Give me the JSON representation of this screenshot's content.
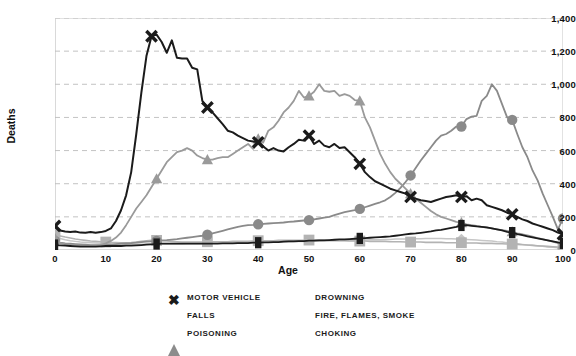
{
  "chart_data": {
    "type": "line",
    "title": "",
    "xlabel": "Age",
    "ylabel": "Deaths",
    "xlim": [
      0,
      100
    ],
    "ylim": [
      0,
      1400
    ],
    "grid": true,
    "grid_style": "dashed-horizontal",
    "legend_position": "bottom",
    "x_ticks": [
      0,
      10,
      20,
      30,
      40,
      50,
      60,
      70,
      80,
      90,
      100
    ],
    "y_ticks": [
      "0",
      "200",
      "400",
      "600",
      "800",
      "1,000",
      "1,200",
      "1,400"
    ],
    "y_tick_values": [
      0,
      200,
      400,
      600,
      800,
      1000,
      1200,
      1400
    ],
    "x": [
      0,
      1,
      2,
      3,
      4,
      5,
      6,
      7,
      8,
      9,
      10,
      11,
      12,
      13,
      14,
      15,
      16,
      17,
      18,
      19,
      20,
      21,
      22,
      23,
      24,
      25,
      26,
      27,
      28,
      29,
      30,
      31,
      32,
      33,
      34,
      35,
      36,
      37,
      38,
      39,
      40,
      41,
      42,
      43,
      44,
      45,
      46,
      47,
      48,
      49,
      50,
      51,
      52,
      53,
      54,
      55,
      56,
      57,
      58,
      59,
      60,
      61,
      62,
      63,
      64,
      65,
      66,
      67,
      68,
      69,
      70,
      71,
      72,
      73,
      74,
      75,
      76,
      77,
      78,
      79,
      80,
      81,
      82,
      83,
      84,
      85,
      86,
      87,
      88,
      89,
      90,
      91,
      92,
      93,
      94,
      95,
      96,
      97,
      98,
      99,
      100
    ],
    "series": [
      {
        "name": "MOTOR VEHICLE",
        "marker": "x",
        "color": "#1b1b1b",
        "width": 2.0,
        "marker_at": [
          0,
          19,
          30,
          40,
          50,
          60,
          70,
          80,
          90,
          100
        ],
        "values": [
          145,
          118,
          112,
          108,
          112,
          105,
          104,
          108,
          104,
          108,
          115,
          130,
          175,
          240,
          330,
          470,
          700,
          950,
          1170,
          1290,
          1300,
          1255,
          1190,
          1265,
          1160,
          1155,
          1155,
          1100,
          1090,
          900,
          860,
          830,
          795,
          760,
          720,
          710,
          690,
          675,
          660,
          655,
          650,
          625,
          600,
          615,
          600,
          595,
          620,
          640,
          665,
          660,
          690,
          640,
          660,
          630,
          620,
          640,
          615,
          620,
          590,
          560,
          520,
          470,
          440,
          415,
          400,
          385,
          370,
          360,
          350,
          340,
          320,
          310,
          300,
          295,
          290,
          300,
          310,
          320,
          325,
          330,
          320,
          325,
          300,
          310,
          300,
          270,
          260,
          250,
          240,
          225,
          215,
          200,
          185,
          175,
          160,
          150,
          140,
          130,
          120,
          105,
          95
        ]
      },
      {
        "name": "FALLS",
        "marker": "circle",
        "color": "#8a8a8a",
        "width": 1.8,
        "marker_at": [
          0,
          20,
          30,
          40,
          50,
          60,
          70,
          80,
          90,
          100
        ],
        "values": [
          55,
          45,
          40,
          38,
          36,
          34,
          32,
          30,
          30,
          30,
          30,
          32,
          35,
          38,
          40,
          42,
          45,
          48,
          50,
          52,
          55,
          58,
          60,
          63,
          66,
          70,
          74,
          78,
          82,
          86,
          92,
          100,
          108,
          116,
          124,
          132,
          140,
          145,
          150,
          152,
          155,
          158,
          160,
          162,
          164,
          166,
          170,
          172,
          175,
          178,
          180,
          185,
          190,
          195,
          200,
          210,
          220,
          228,
          235,
          240,
          248,
          258,
          268,
          278,
          288,
          300,
          320,
          345,
          375,
          410,
          450,
          495,
          540,
          580,
          620,
          660,
          690,
          700,
          720,
          745,
          745,
          790,
          805,
          810,
          900,
          930,
          1000,
          960,
          880,
          800,
          785,
          700,
          620,
          560,
          480,
          420,
          340,
          270,
          200,
          125,
          190
        ]
      },
      {
        "name": "POISONING",
        "marker": "triangle",
        "color": "#9a9a9a",
        "width": 1.8,
        "marker_at": [
          0,
          20,
          30,
          40,
          50,
          60,
          70,
          80,
          90,
          100
        ],
        "values": [
          70,
          42,
          35,
          32,
          30,
          28,
          27,
          26,
          26,
          30,
          40,
          55,
          75,
          105,
          150,
          200,
          250,
          290,
          330,
          380,
          430,
          480,
          530,
          560,
          590,
          600,
          615,
          600,
          570,
          555,
          545,
          545,
          555,
          560,
          560,
          580,
          600,
          620,
          640,
          610,
          670,
          650,
          720,
          740,
          780,
          830,
          860,
          900,
          960,
          920,
          930,
          955,
          1000,
          960,
          955,
          960,
          930,
          940,
          930,
          905,
          900,
          800,
          740,
          660,
          580,
          520,
          470,
          430,
          400,
          370,
          340,
          310,
          285,
          260,
          235,
          215,
          200,
          190,
          180,
          170,
          165,
          155,
          150,
          145,
          140,
          135,
          130,
          125,
          120,
          115,
          110,
          100,
          95,
          88,
          80,
          72,
          65,
          58,
          50,
          42,
          35
        ]
      },
      {
        "name": "DROWNING",
        "marker": "square",
        "color": "#b3b3b3",
        "width": 1.6,
        "marker_at": [
          0,
          10,
          20,
          30,
          40,
          50,
          60,
          70,
          80,
          90,
          100
        ],
        "values": [
          90,
          85,
          78,
          72,
          66,
          62,
          58,
          54,
          52,
          50,
          48,
          46,
          45,
          44,
          44,
          45,
          48,
          52,
          55,
          58,
          58,
          56,
          54,
          52,
          50,
          48,
          48,
          48,
          48,
          48,
          50,
          50,
          50,
          50,
          50,
          52,
          52,
          52,
          52,
          54,
          56,
          56,
          56,
          56,
          58,
          58,
          58,
          58,
          58,
          58,
          60,
          60,
          60,
          60,
          58,
          58,
          56,
          56,
          54,
          54,
          54,
          54,
          52,
          52,
          52,
          52,
          50,
          50,
          50,
          48,
          48,
          48,
          48,
          46,
          46,
          46,
          46,
          44,
          44,
          44,
          44,
          42,
          42,
          42,
          40,
          40,
          40,
          38,
          38,
          36,
          36,
          34,
          32,
          30,
          28,
          26,
          24,
          22,
          20,
          18,
          16
        ]
      },
      {
        "name": "FIRE, FLAMES, SMOKE",
        "marker": "diamond",
        "color": "#c6c6c6",
        "width": 1.5,
        "marker_at": [
          0,
          20,
          40,
          60,
          80,
          100
        ],
        "values": [
          80,
          70,
          62,
          56,
          52,
          48,
          46,
          44,
          42,
          40,
          38,
          36,
          35,
          34,
          34,
          34,
          34,
          35,
          36,
          36,
          36,
          36,
          36,
          36,
          36,
          36,
          38,
          38,
          38,
          38,
          40,
          40,
          40,
          42,
          42,
          42,
          44,
          44,
          44,
          46,
          46,
          46,
          48,
          48,
          48,
          50,
          50,
          52,
          52,
          52,
          54,
          54,
          54,
          56,
          56,
          56,
          58,
          58,
          58,
          58,
          60,
          60,
          62,
          62,
          62,
          64,
          64,
          66,
          66,
          66,
          68,
          68,
          68,
          70,
          70,
          70,
          70,
          68,
          68,
          66,
          66,
          64,
          62,
          60,
          58,
          56,
          54,
          50,
          48,
          44,
          40,
          38,
          34,
          30,
          28,
          24,
          22,
          18,
          16,
          14,
          12
        ]
      },
      {
        "name": "CHOKING",
        "marker": "rect",
        "color": "#1b1b1b",
        "width": 1.8,
        "marker_at": [
          0,
          20,
          40,
          60,
          80,
          90,
          100
        ],
        "values": [
          30,
          28,
          26,
          24,
          22,
          20,
          20,
          20,
          20,
          22,
          24,
          24,
          24,
          24,
          26,
          26,
          28,
          30,
          32,
          34,
          36,
          38,
          38,
          38,
          38,
          38,
          38,
          38,
          38,
          38,
          38,
          38,
          38,
          40,
          40,
          40,
          42,
          42,
          42,
          44,
          44,
          46,
          46,
          48,
          48,
          50,
          52,
          52,
          54,
          54,
          56,
          56,
          58,
          58,
          60,
          62,
          64,
          64,
          66,
          68,
          70,
          72,
          74,
          76,
          78,
          80,
          82,
          86,
          90,
          94,
          98,
          100,
          104,
          108,
          112,
          118,
          122,
          128,
          134,
          140,
          148,
          150,
          146,
          142,
          140,
          136,
          130,
          124,
          118,
          110,
          105,
          96,
          90,
          82,
          76,
          70,
          64,
          58,
          52,
          46,
          40
        ]
      }
    ]
  },
  "axis": {
    "y_label": "Deaths",
    "x_label": "Age"
  },
  "legend": {
    "items": [
      {
        "label": "MOTOR VEHICLE",
        "marker": "x-marker-icon",
        "color": "#1b1b1b"
      },
      {
        "label": "DROWNING",
        "marker": "square-marker-icon",
        "color": "#b3b3b3"
      },
      {
        "label": "FALLS",
        "marker": "circle-marker-icon",
        "color": "#7d7d7d"
      },
      {
        "label": "FIRE, FLAMES, SMOKE",
        "marker": "diamond-marker-icon",
        "color": "#c2c2c2"
      },
      {
        "label": "POISONING",
        "marker": "triangle-marker-icon",
        "color": "#8c8c8c"
      },
      {
        "label": "CHOKING",
        "marker": "rect-marker-icon",
        "color": "#1b1b1b"
      }
    ]
  },
  "title": ""
}
